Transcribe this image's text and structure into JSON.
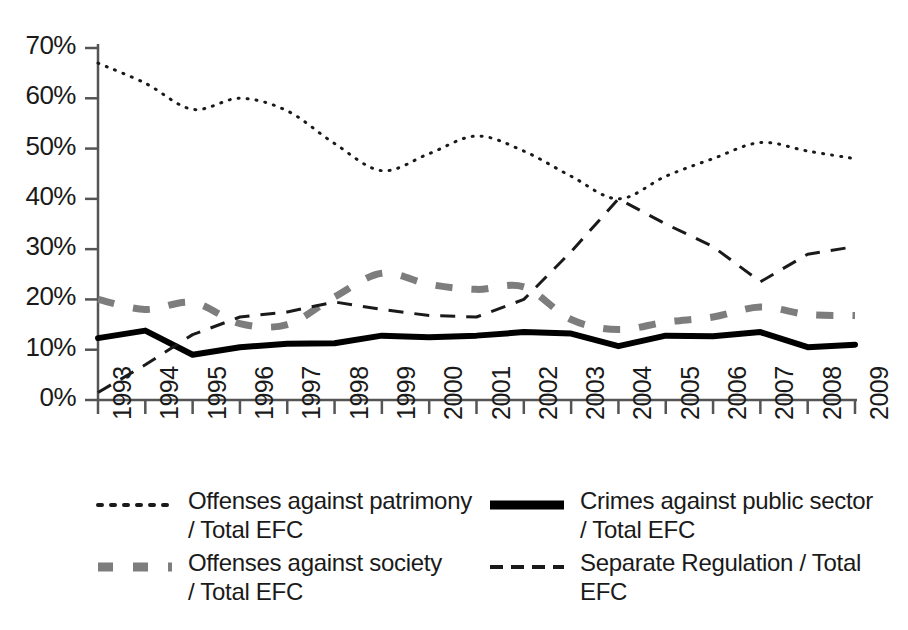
{
  "chart_data": {
    "type": "line",
    "title": "",
    "subtitle": "",
    "xlabel": "",
    "ylabel": "",
    "x": [
      1993,
      1994,
      1995,
      1996,
      1997,
      1998,
      1999,
      2000,
      2001,
      2002,
      2003,
      2004,
      2005,
      2006,
      2007,
      2008,
      2009
    ],
    "categories": [
      "1993",
      "1994",
      "1995",
      "1996",
      "1997",
      "1998",
      "1999",
      "2000",
      "2001",
      "2002",
      "2003",
      "2004",
      "2005",
      "2006",
      "2007",
      "2008",
      "2009"
    ],
    "xlim": [
      1993,
      2009
    ],
    "ylim": [
      0,
      70
    ],
    "ytick_values": [
      0,
      10,
      20,
      30,
      40,
      50,
      60,
      70
    ],
    "ytick_labels": [
      "0%",
      "10%",
      "20%",
      "30%",
      "40%",
      "50%",
      "60%",
      "70%"
    ],
    "grid": false,
    "legend_position": "bottom",
    "series": [
      {
        "name": "Offenses against patrimony / Total EFC",
        "label_line1": "Offenses against patrimony",
        "label_line2": "/ Total EFC",
        "style": "dotted",
        "color": "#1a1a1a",
        "width": 3,
        "values": [
          67.0,
          63.0,
          57.8,
          60.0,
          57.5,
          51.0,
          45.6,
          49.0,
          52.5,
          49.5,
          44.5,
          40.0,
          44.5,
          48.0,
          51.2,
          49.5,
          48.0
        ]
      },
      {
        "name": "Offenses against society / Total EFC",
        "label_line1": "Offenses against society",
        "label_line2": "/ Total EFC",
        "style": "dashed-thick",
        "color": "#7d7d7d",
        "width": 7,
        "values": [
          20.0,
          18.0,
          19.4,
          15.2,
          15.0,
          20.5,
          25.2,
          23.0,
          22.0,
          22.5,
          16.0,
          14.0,
          15.5,
          16.5,
          18.5,
          17.0,
          16.8
        ]
      },
      {
        "name": "Crimes against public sector / Total EFC",
        "label_line1": "Crimes against public sector",
        "label_line2": "/ Total EFC",
        "style": "solid",
        "color": "#000000",
        "width": 6,
        "values": [
          12.3,
          13.8,
          9.0,
          10.5,
          11.2,
          11.3,
          12.8,
          12.5,
          12.8,
          13.5,
          13.2,
          10.7,
          12.8,
          12.7,
          13.5,
          10.5,
          11.0
        ]
      },
      {
        "name": "Separate Regulation / Total EFC",
        "label_line1": "Separate Regulation / Total",
        "label_line2": "EFC",
        "style": "dashed-thin",
        "color": "#1a1a1a",
        "width": 3,
        "values": [
          1.5,
          7.0,
          13.0,
          16.5,
          17.5,
          19.5,
          18.0,
          16.8,
          16.5,
          20.0,
          29.5,
          40.0,
          35.0,
          30.5,
          23.5,
          29.0,
          30.5
        ]
      }
    ]
  },
  "legend": {
    "entries": [
      {
        "swatch": "dotted-swatch",
        "line1": "Offenses against patrimony",
        "line2": "/ Total EFC"
      },
      {
        "swatch": "dashed-thick-swatch",
        "line1": "Offenses against society",
        "line2": "/ Total EFC"
      },
      {
        "swatch": "solid-swatch",
        "line1": "Crimes against public sector",
        "line2": "/ Total EFC"
      },
      {
        "swatch": "dashed-thin-swatch",
        "line1": "Separate Regulation / Total",
        "line2": "EFC"
      }
    ]
  }
}
